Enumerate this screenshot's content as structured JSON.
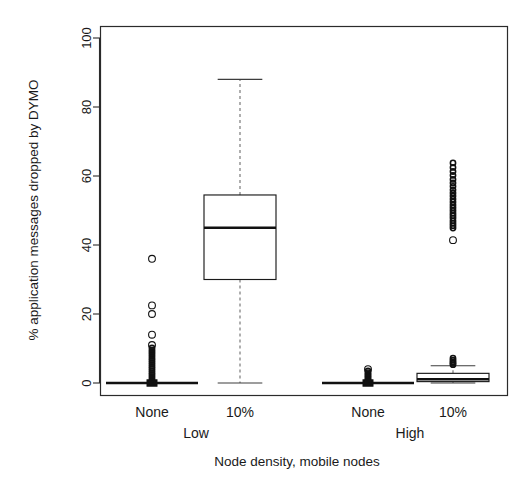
{
  "chart_data": {
    "type": "box",
    "title": "",
    "xlabel": "Node density, mobile nodes",
    "ylabel": "% application messages dropped by DYMO",
    "ylim": [
      0,
      103
    ],
    "yticks": [
      0,
      20,
      40,
      60,
      80,
      100
    ],
    "ytick_labels": [
      "0",
      "20",
      "40",
      "60",
      "80",
      "100"
    ],
    "grid": false,
    "legend": "none",
    "x_tick_labels": [
      "None",
      "10%",
      "None",
      "10%"
    ],
    "x_group_labels": [
      "Low",
      "High"
    ],
    "categories": [
      "Low / None",
      "Low / 10%",
      "High / None",
      "High / 10%"
    ],
    "boxes": [
      {
        "label": "Low / None",
        "group": "Low",
        "mobile_nodes": "None",
        "min": 0,
        "q1": 0,
        "median": 0,
        "q3": 0,
        "max": 0,
        "whisker_low": 0,
        "whisker_high": 0,
        "outliers": [
          36.0,
          22.5,
          20.0,
          14.0,
          11.0,
          10.2,
          9.6,
          9.0,
          8.4,
          7.8,
          7.2,
          6.6,
          6.0,
          5.4,
          4.8,
          4.2,
          3.6,
          3.0,
          2.4,
          1.8,
          1.2,
          0.6,
          0.3
        ]
      },
      {
        "label": "Low / 10%",
        "group": "Low",
        "mobile_nodes": "10%",
        "min": 0,
        "q1": 30.0,
        "median": 45.0,
        "q3": 54.5,
        "max": 88.0,
        "whisker_low": 0,
        "whisker_high": 88.0,
        "outliers": []
      },
      {
        "label": "High / None",
        "group": "High",
        "mobile_nodes": "None",
        "min": 0,
        "q1": 0,
        "median": 0,
        "q3": 0,
        "max": 0,
        "whisker_low": 0,
        "whisker_high": 0,
        "outliers": [
          4.0,
          3.5,
          3.0,
          2.6,
          2.2,
          1.8,
          1.4,
          1.0,
          0.6,
          0.3
        ]
      },
      {
        "label": "High / 10%",
        "group": "High",
        "mobile_nodes": "10%",
        "min": 0,
        "q1": 0.4,
        "median": 1.1,
        "q3": 2.8,
        "max": 5.0,
        "whisker_low": 0,
        "whisker_high": 5.0,
        "outliers": [
          63.8,
          62.5,
          61.3,
          60.2,
          59.0,
          58.0,
          57.0,
          56.0,
          55.1,
          54.2,
          53.3,
          52.5,
          51.6,
          50.8,
          50.0,
          49.2,
          48.5,
          47.8,
          47.0,
          46.3,
          45.6,
          44.9,
          41.4,
          7.2,
          6.6,
          6.1,
          5.7,
          5.3
        ]
      }
    ]
  },
  "axes": {
    "y_title": "% application messages dropped by DYMO",
    "x_title": "Node density, mobile nodes"
  },
  "labels": {
    "tick_0": "0",
    "tick_20": "20",
    "tick_40": "40",
    "tick_60": "60",
    "tick_80": "80",
    "tick_100": "100",
    "cat_1": "None",
    "cat_2": "10%",
    "cat_3": "None",
    "cat_4": "10%",
    "group_low": "Low",
    "group_high": "High"
  },
  "colors": {
    "background": "#ffffff",
    "axis": "#2b2b2b",
    "box_outline": "#1a1a1a",
    "median": "#111111",
    "whisker": "#6d6d6d",
    "outlier": "#111111"
  }
}
